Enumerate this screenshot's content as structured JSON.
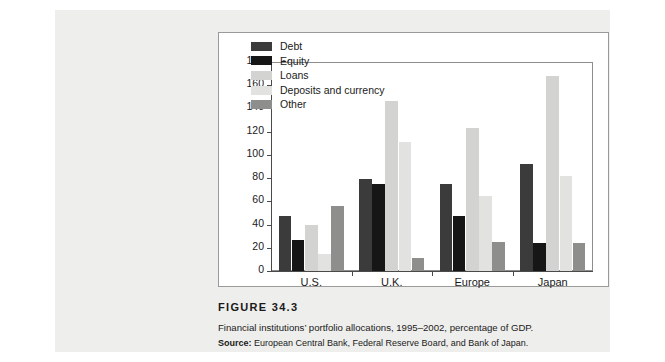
{
  "figure": {
    "title": "FIGURE 34.3",
    "description": "Financial institutions’ portfolio allocations, 1995–2002, percentage of GDP.",
    "source_label": "Source:",
    "source_text": "European Central Bank, Federal Reserve Board, and Bank of Japan."
  },
  "chart_data": {
    "type": "bar",
    "title": "",
    "xlabel": "",
    "ylabel": "%",
    "unit_label": "%",
    "categories": [
      "U.S.",
      "U.K.",
      "Europe",
      "Japan"
    ],
    "series": [
      {
        "name": "Debt",
        "color": "#3b3b3b",
        "values": [
          47,
          79,
          75,
          92
        ]
      },
      {
        "name": "Equity",
        "color": "#161616",
        "values": [
          27,
          75,
          47,
          24
        ]
      },
      {
        "name": "Loans",
        "color": "#d3d3d1",
        "values": [
          40,
          146,
          123,
          168
        ]
      },
      {
        "name": "Deposits and currency",
        "color": "#e2e2e0",
        "values": [
          15,
          111,
          65,
          82
        ]
      },
      {
        "name": "Other",
        "color": "#8e8e8c",
        "values": [
          56,
          11,
          25,
          24
        ]
      }
    ],
    "ylim": [
      0,
      180
    ],
    "yticks": [
      0,
      20,
      40,
      60,
      80,
      100,
      120,
      140,
      160,
      180
    ],
    "grid": false,
    "legend_position": "upper-left"
  }
}
